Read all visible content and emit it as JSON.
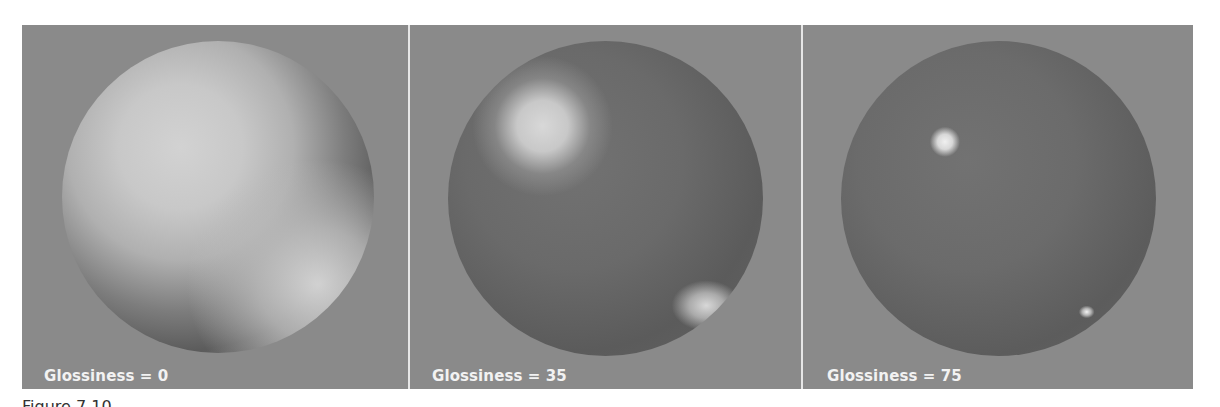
{
  "figure": {
    "panels": [
      {
        "label": "Glossiness = 0",
        "glossiness": 0,
        "description": "sphere with broad diffuse highlight"
      },
      {
        "label": "Glossiness = 35",
        "glossiness": 35,
        "description": "sphere with medium soft specular highlights"
      },
      {
        "label": "Glossiness = 75",
        "glossiness": 75,
        "description": "sphere with small sharp specular highlights"
      }
    ],
    "caption": "Figure 7.10"
  },
  "colors": {
    "background": "#8a8a8a",
    "divider": "#e6e6e6",
    "label_text": "#f2f2f2",
    "page": "#ffffff"
  }
}
